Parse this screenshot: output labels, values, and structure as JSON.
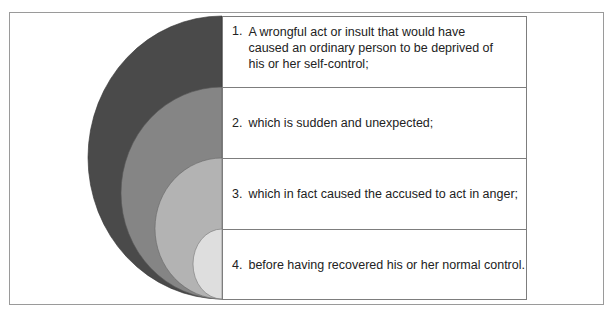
{
  "diagram": {
    "type": "nested-semicircles",
    "colors": [
      "#4a4a4a",
      "#858585",
      "#b3b3b3",
      "#dcdcdc"
    ],
    "items": [
      {
        "number": "1.",
        "text": "A wrongful act or insult that would have caused an ordinary person to be deprived of his or her self-control;"
      },
      {
        "number": "2.",
        "text": "which is sudden and unexpected;"
      },
      {
        "number": "3.",
        "text": "which in fact caused the accused to act in anger;"
      },
      {
        "number": "4.",
        "text": "before having recovered his or her normal control."
      }
    ]
  }
}
